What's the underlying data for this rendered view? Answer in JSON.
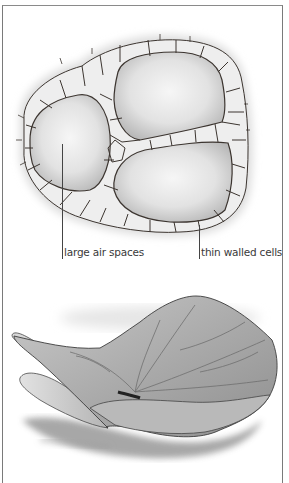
{
  "figure": {
    "top_panel": {
      "subject": "cross-section of tissue with large air spaces",
      "labels": [
        {
          "text": "large air spaces",
          "target": "air-space"
        },
        {
          "text": "thin walled cells",
          "target": "cell-wall"
        }
      ]
    },
    "bottom_panel": {
      "subject": "floating leaf illustration"
    },
    "colors": {
      "background": "#ffffff",
      "frame": "#7a7a7a",
      "cell_wall": "#3c3530",
      "cell_fill": "#eeeeee",
      "air_space": "#d4d4d4",
      "label_text": "#3a3a3a"
    }
  }
}
